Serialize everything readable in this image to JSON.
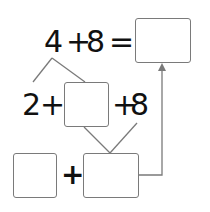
{
  "diagram": {
    "top_equation": {
      "left_operand": "4",
      "operator": "+",
      "right_operand": "8",
      "equals": "=",
      "answer_box": ""
    },
    "middle_row": {
      "first_term": "2",
      "plus_1": "+",
      "blank_box": "",
      "plus_2": "+",
      "last_term": "8"
    },
    "bottom_row": {
      "box_1": "",
      "plus": "+",
      "box_2": ""
    },
    "colors": {
      "text": "#111111",
      "lines": "#7a7a7a",
      "background": "#ffffff"
    }
  }
}
